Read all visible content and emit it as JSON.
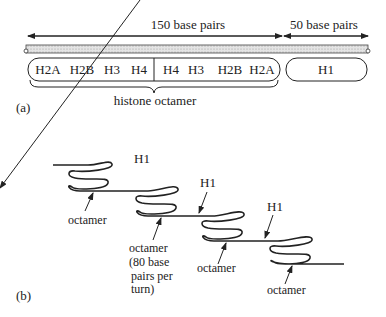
{
  "panel_a": {
    "label": "(a)",
    "span_left_label": "150 base pairs",
    "span_right_label": "50 base pairs",
    "octamer_boxes": [
      "H2A",
      "H2B",
      "H3",
      "H4",
      "H4",
      "H3",
      "H2B",
      "H2A"
    ],
    "linker_box": "H1",
    "brace_label": "histone octamer"
  },
  "panel_b": {
    "label": "(b)",
    "h1_labels": [
      "H1",
      "H1",
      "H1"
    ],
    "octamer_labels": [
      "octamer",
      "octamer",
      "octamer",
      "octamer"
    ],
    "octamer_note_lines": [
      "(80 base",
      "pairs per",
      "turn)"
    ]
  }
}
